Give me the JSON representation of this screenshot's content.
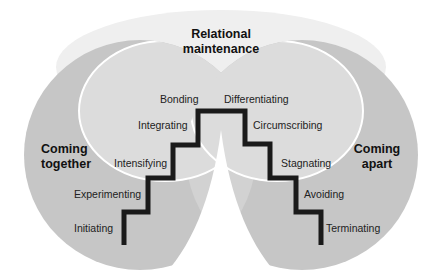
{
  "diagram": {
    "type": "relationship-stages-staircase",
    "regions": {
      "top": {
        "title_line1": "Relational",
        "title_line2": "maintenance",
        "color": "#ececec"
      },
      "left": {
        "title_line1": "Coming",
        "title_line2": "together",
        "color": "#c4c4c4"
      },
      "right": {
        "title_line1": "Coming",
        "title_line2": "apart",
        "color": "#c4c4c4"
      },
      "overlap_color": "#d9d9d9"
    },
    "stages_up": [
      "Initiating",
      "Experimenting",
      "Intensifying",
      "Integrating",
      "Bonding"
    ],
    "stages_down": [
      "Differentiating",
      "Circumscribing",
      "Stagnating",
      "Avoiding",
      "Terminating"
    ],
    "stair_color": "#1a1a1a"
  }
}
